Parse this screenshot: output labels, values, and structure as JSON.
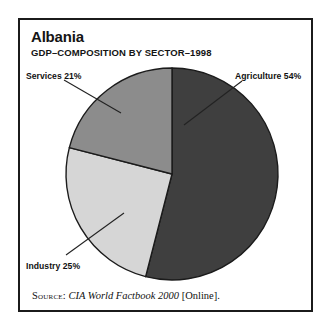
{
  "figure": {
    "title": "Albania",
    "subtitle": "GDP–COMPOSITION BY SECTOR–1998",
    "source": {
      "kicker": "Source:",
      "work": "CIA World Factbook 2000",
      "suffix": "[Online]."
    },
    "frame_color": "#1b1b1b",
    "background": "#ffffff"
  },
  "labels": {
    "services": "Services 21%",
    "agriculture": "Agriculture 54%",
    "industry": "Industry 25%"
  },
  "chart_data": {
    "type": "pie",
    "title": "Albania",
    "subtitle": "GDP–COMPOSITION BY SECTOR–1998",
    "xlabel": "",
    "ylabel": "",
    "unit": "percent",
    "total": 100,
    "start_angle_deg": 0,
    "direction": "clockwise",
    "legend_position": "callout-labels",
    "grid": false,
    "categories": [
      "Agriculture",
      "Industry",
      "Services"
    ],
    "values": [
      54,
      25,
      21
    ],
    "slices": [
      {
        "name": "Agriculture",
        "value": 54,
        "label": "Agriculture 54%",
        "color": "#3f3f3f",
        "start_deg": 0,
        "end_deg": 194.4
      },
      {
        "name": "Industry",
        "value": 25,
        "label": "Industry 25%",
        "color": "#d6d6d6",
        "start_deg": 194.4,
        "end_deg": 284.4
      },
      {
        "name": "Services",
        "value": 21,
        "label": "Services 21%",
        "color": "#8c8c8c",
        "start_deg": 284.4,
        "end_deg": 360
      }
    ],
    "annotations": [
      {
        "text": "Agriculture 54%",
        "target": "Agriculture"
      },
      {
        "text": "Industry 25%",
        "target": "Industry"
      },
      {
        "text": "Services 21%",
        "target": "Services"
      }
    ]
  }
}
